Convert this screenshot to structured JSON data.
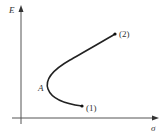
{
  "diagram": {
    "axes": {
      "y_label": "E",
      "x_label": "σ"
    },
    "points": [
      {
        "id": "1",
        "label": "(1)"
      },
      {
        "id": "A",
        "label": "A"
      },
      {
        "id": "2",
        "label": "(2)"
      }
    ],
    "colors": {
      "axis": "#555555",
      "curve": "#222222",
      "text": "#333333"
    }
  }
}
